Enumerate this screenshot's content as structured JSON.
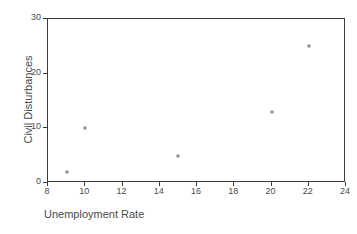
{
  "chart_data": {
    "type": "scatter",
    "title": "",
    "xlabel": "Unemployment Rate",
    "ylabel": "Civil Disturbances",
    "xlim": [
      8,
      24
    ],
    "ylim": [
      0,
      30
    ],
    "xticks": [
      8,
      10,
      12,
      14,
      16,
      18,
      20,
      22,
      24
    ],
    "xtick_labels": [
      "8",
      "10",
      "12",
      "14",
      "16",
      "18",
      "20",
      "22",
      "24"
    ],
    "yticks": [
      0,
      10,
      20,
      30
    ],
    "ytick_labels": [
      "0",
      "10",
      "20",
      "30"
    ],
    "grid": false,
    "legend": null,
    "marker": {
      "shape": "square",
      "color": "#8c8c8c",
      "size_px": 3
    },
    "frame_color": "#3b3b3b",
    "background": "#ffffff",
    "points": [
      {
        "x": 9,
        "y": 2
      },
      {
        "x": 10,
        "y": 10
      },
      {
        "x": 15,
        "y": 5
      },
      {
        "x": 20,
        "y": 13
      },
      {
        "x": 22,
        "y": 25
      }
    ],
    "series": [
      {
        "name": "",
        "x": [
          9,
          10,
          15,
          20,
          22
        ],
        "values": [
          2,
          10,
          5,
          13,
          25
        ]
      }
    ]
  }
}
